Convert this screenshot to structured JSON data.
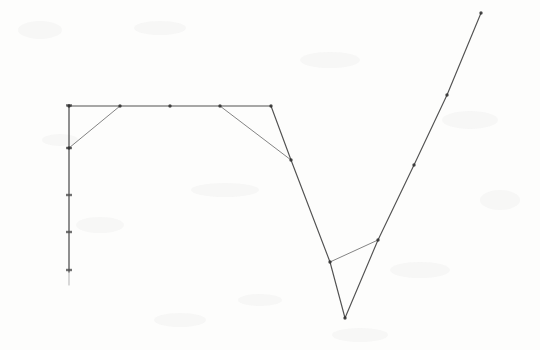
{
  "figure": {
    "title": "",
    "background_color": "#fdfdfc",
    "ink_color": "#3a3a3a",
    "axis_color": "#4a4a4a",
    "medium": "scanned pencil line drawing on white paper",
    "width": 540,
    "height": 350
  },
  "chart_data": {
    "type": "line",
    "title": "",
    "subtitle": "",
    "xlabel": "",
    "ylabel": "",
    "xlim": [
      0,
      540
    ],
    "ylim": [
      0,
      350
    ],
    "grid": false,
    "legend": "none",
    "axis_orientation": "y-axis at left, values increase upward",
    "axes": {
      "y_axis": {
        "x_pixel": 69,
        "top_pixel": 105,
        "bottom_pixel": 272,
        "tick_pixels_y": [
          105,
          148,
          195,
          232,
          270
        ],
        "tick_labels": [
          "",
          "",
          "",
          "",
          ""
        ]
      }
    },
    "series": [
      {
        "name": "plateau-series",
        "style": "solid",
        "marker": "dot",
        "points_pixel": [
          [
            69,
            106
          ],
          [
            120,
            106
          ],
          [
            170,
            106
          ],
          [
            220,
            106
          ],
          [
            271,
            106
          ]
        ]
      },
      {
        "name": "rise-to-plateau-series",
        "style": "solid",
        "marker": "dot",
        "points_pixel": [
          [
            69,
            148
          ],
          [
            120,
            106
          ]
        ]
      },
      {
        "name": "descent-series",
        "style": "solid",
        "marker": "dot",
        "points_pixel": [
          [
            220,
            106
          ],
          [
            291,
            160
          ]
        ]
      },
      {
        "name": "main-valley-series",
        "style": "solid",
        "marker": "dot",
        "points_pixel": [
          [
            271,
            106
          ],
          [
            291,
            160
          ],
          [
            330,
            262
          ],
          [
            345,
            318
          ]
        ]
      },
      {
        "name": "recovery-series",
        "style": "solid",
        "marker": "dot",
        "points_pixel": [
          [
            345,
            318
          ],
          [
            378,
            240
          ],
          [
            414,
            165
          ],
          [
            447,
            95
          ],
          [
            481,
            13
          ]
        ]
      },
      {
        "name": "valley-chord-series",
        "style": "solid",
        "marker": "dot",
        "points_pixel": [
          [
            330,
            262
          ],
          [
            378,
            240
          ]
        ]
      }
    ],
    "vertex_markers_pixel": [
      [
        69,
        106
      ],
      [
        120,
        106
      ],
      [
        170,
        106
      ],
      [
        220,
        106
      ],
      [
        271,
        106
      ],
      [
        69,
        148
      ],
      [
        291,
        160
      ],
      [
        330,
        262
      ],
      [
        345,
        318
      ],
      [
        378,
        240
      ],
      [
        414,
        165
      ],
      [
        447,
        95
      ],
      [
        481,
        13
      ]
    ]
  }
}
